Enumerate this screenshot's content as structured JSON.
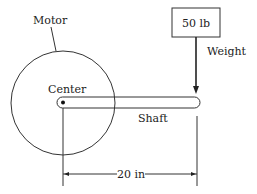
{
  "diagram": {
    "labels": {
      "motor": "Motor",
      "center": "Center",
      "shaft": "Shaft",
      "weight": "Weight",
      "weight_value": "50 lb",
      "dimension": "20 in"
    },
    "colors": {
      "stroke": "#333333",
      "background": "#ffffff"
    }
  }
}
